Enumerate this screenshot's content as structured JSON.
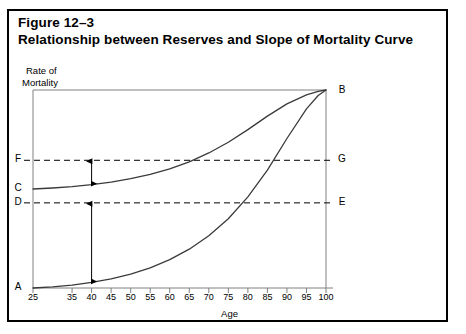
{
  "figure": {
    "number": "Figure 12–3",
    "caption": "Relationship between Reserves and Slope of Mortality Curve"
  },
  "chart_data": {
    "type": "line",
    "title": "Relationship between Reserves and Slope of Mortality Curve",
    "xlabel": "Age",
    "ylabel_line1": "Rate of",
    "ylabel_line2": "Mortality",
    "xlim": [
      25,
      100
    ],
    "ylim": [
      0,
      1
    ],
    "grid": false,
    "legend": "none",
    "xticks": [
      25,
      35,
      40,
      45,
      50,
      55,
      60,
      65,
      70,
      75,
      80,
      85,
      90,
      95,
      100
    ],
    "xtick_labels": [
      "25",
      "35",
      "40",
      "45",
      "50",
      "55",
      "60",
      "65",
      "70",
      "75",
      "80",
      "85",
      "90",
      "95",
      "100"
    ],
    "series": [
      {
        "name": "level-premium-curve",
        "description": "Flatter curve rising from C to B",
        "start_label": "C",
        "end_label": "B",
        "x": [
          25,
          30,
          35,
          40,
          45,
          50,
          55,
          60,
          65,
          70,
          75,
          80,
          85,
          90,
          95,
          98,
          100
        ],
        "y": [
          0.5,
          0.505,
          0.512,
          0.522,
          0.535,
          0.552,
          0.574,
          0.602,
          0.637,
          0.682,
          0.736,
          0.8,
          0.868,
          0.93,
          0.975,
          0.993,
          1.0
        ]
      },
      {
        "name": "natural-premium-curve",
        "description": "Steeper curve rising from A to B",
        "start_label": "A",
        "end_label": "B",
        "x": [
          25,
          30,
          35,
          40,
          45,
          50,
          55,
          60,
          65,
          70,
          75,
          80,
          85,
          90,
          95,
          98,
          100
        ],
        "y": [
          0.0,
          0.006,
          0.015,
          0.028,
          0.046,
          0.07,
          0.102,
          0.143,
          0.196,
          0.264,
          0.35,
          0.46,
          0.595,
          0.755,
          0.905,
          0.972,
          1.0
        ]
      }
    ],
    "reference_lines": [
      {
        "name": "line-F-G",
        "style": "dashed",
        "left_label": "F",
        "right_label": "G",
        "y": 0.645
      },
      {
        "name": "line-D-E",
        "style": "dashed",
        "left_label": "D",
        "right_label": "E",
        "y": 0.43
      }
    ],
    "annotations": [
      {
        "name": "upper-reserve-arrow",
        "type": "double-headed-arrow",
        "x": 40,
        "from_label": "C",
        "to_label": "F"
      },
      {
        "name": "lower-reserve-arrow",
        "type": "double-headed-arrow",
        "x": 40,
        "from_label": "A",
        "to_label": "D"
      }
    ],
    "point_labels": {
      "A": "A",
      "B": "B",
      "C": "C",
      "D": "D",
      "E": "E",
      "F": "F",
      "G": "G"
    }
  },
  "colors": {
    "border": "#000000",
    "curve": "#3a3a3a",
    "axis": "#808080",
    "dashed": "#000000",
    "background": "#ffffff"
  }
}
